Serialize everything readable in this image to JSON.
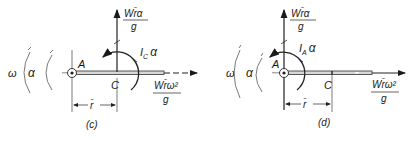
{
  "figures": [
    {
      "id": "c",
      "caption": "(c)",
      "pivot_label": "A",
      "center_label": "C",
      "distance_label": "r̄",
      "omega_label": "ω",
      "alpha_label": "α",
      "vertical_force": {
        "numerator": "Wr̄α",
        "denominator": "g"
      },
      "horizontal_force": {
        "numerator": "Wr̄ω²",
        "denominator": "g"
      },
      "moment": {
        "symbol": "I",
        "subscript": "C",
        "suffix": "α"
      }
    },
    {
      "id": "d",
      "caption": "(d)",
      "pivot_label": "A",
      "center_label": "C",
      "distance_label": "r̄",
      "omega_label": "ω",
      "alpha_label": "α",
      "vertical_force": {
        "numerator": "Wr̄α",
        "denominator": "g"
      },
      "horizontal_force": {
        "numerator": "Wr̄ω²",
        "denominator": "g"
      },
      "moment": {
        "symbol": "I",
        "subscript": "A",
        "suffix": "α"
      }
    }
  ]
}
